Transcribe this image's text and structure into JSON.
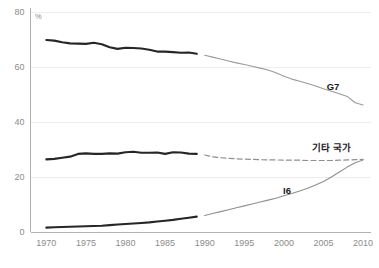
{
  "chart_data": {
    "type": "line",
    "title": "",
    "subtitle": "",
    "xlabel": "",
    "ylabel": "",
    "unit_label": "%",
    "xlim": [
      1968,
      2011
    ],
    "ylim": [
      0,
      80
    ],
    "grid": true,
    "grid_axis": "y",
    "legend_position": "inline-right",
    "break_year": 1990,
    "note": "Each series is drawn as a thick dark solid segment for 1970-1989 and a thin grey segment (solid or dashed) for 1990-2010.",
    "yticks": [
      0,
      20,
      40,
      60,
      80
    ],
    "ytick_labels": [
      "0",
      "20",
      "40",
      "60",
      "80"
    ],
    "xticks": [
      1970,
      1975,
      1980,
      1985,
      1990,
      1995,
      2000,
      2005,
      2010
    ],
    "xtick_labels": [
      "1970",
      "1975",
      "1980",
      "1985",
      "1990",
      "1995",
      "2000",
      "2005",
      "2010"
    ],
    "series": [
      {
        "name": "G7",
        "label": "G7",
        "label_x": 2006.2,
        "label_y": 51.5,
        "color": "#9a9a9a",
        "early_color": "#262626",
        "style_early": "solid-thick",
        "style_late": "solid-thin",
        "x": [
          1970,
          1971,
          1972,
          1973,
          1974,
          1975,
          1976,
          1977,
          1978,
          1979,
          1980,
          1981,
          1982,
          1983,
          1984,
          1985,
          1986,
          1987,
          1988,
          1989
        ],
        "values": [
          69.8,
          69.6,
          69.0,
          68.6,
          68.5,
          68.4,
          68.8,
          68.3,
          67.2,
          66.6,
          67.0,
          66.9,
          66.7,
          66.3,
          65.6,
          65.6,
          65.4,
          65.2,
          65.3,
          64.8
        ],
        "x_late": [
          1990,
          1991,
          1992,
          1993,
          1994,
          1995,
          1996,
          1997,
          1998,
          1999,
          2000,
          2001,
          2002,
          2003,
          2004,
          2005,
          2006,
          2007,
          2008,
          2009,
          2010
        ],
        "values_late": [
          64.3,
          63.6,
          62.9,
          62.2,
          61.5,
          60.9,
          60.3,
          59.6,
          58.9,
          57.9,
          56.6,
          55.6,
          54.8,
          54.0,
          53.1,
          52.1,
          51.2,
          50.3,
          49.3,
          47.0,
          46.2
        ]
      },
      {
        "name": "기타 국가",
        "label": "기타 국가",
        "label_x": 2006.0,
        "label_y": 29.6,
        "color": "#8f8f8f",
        "early_color": "#262626",
        "style_early": "solid-thick",
        "style_late": "dashed-thin",
        "x": [
          1970,
          1971,
          1972,
          1973,
          1974,
          1975,
          1976,
          1977,
          1978,
          1979,
          1980,
          1981,
          1982,
          1983,
          1984,
          1985,
          1986,
          1987,
          1988,
          1989
        ],
        "values": [
          26.4,
          26.6,
          27.0,
          27.4,
          28.4,
          28.6,
          28.4,
          28.4,
          28.6,
          28.5,
          29.0,
          29.2,
          28.8,
          28.8,
          28.9,
          28.4,
          29.0,
          28.9,
          28.5,
          28.4
        ],
        "x_late": [
          1990,
          1991,
          1992,
          1993,
          1994,
          1995,
          1996,
          1997,
          1998,
          1999,
          2000,
          2001,
          2002,
          2003,
          2004,
          2005,
          2006,
          2007,
          2008,
          2009,
          2010
        ],
        "values_late": [
          28.0,
          27.3,
          27.0,
          26.8,
          26.6,
          26.5,
          26.4,
          26.3,
          26.2,
          26.2,
          26.1,
          26.1,
          26.1,
          26.0,
          26.0,
          26.0,
          26.0,
          26.1,
          26.2,
          26.3,
          26.4
        ]
      },
      {
        "name": "I6",
        "label": "I6",
        "label_x": 2000.4,
        "label_y": 13.9,
        "color": "#8f8f8f",
        "early_color": "#262626",
        "style_early": "solid-thick",
        "style_late": "solid-thin",
        "x": [
          1970,
          1971,
          1972,
          1973,
          1974,
          1975,
          1976,
          1977,
          1978,
          1979,
          1980,
          1981,
          1982,
          1983,
          1984,
          1985,
          1986,
          1987,
          1988,
          1989
        ],
        "values": [
          1.6,
          1.7,
          1.8,
          1.9,
          2.0,
          2.1,
          2.2,
          2.3,
          2.5,
          2.7,
          2.9,
          3.1,
          3.3,
          3.5,
          3.8,
          4.1,
          4.4,
          4.8,
          5.2,
          5.6
        ],
        "x_late": [
          1990,
          1991,
          1992,
          1993,
          1994,
          1995,
          1996,
          1997,
          1998,
          1999,
          2000,
          2001,
          2002,
          2003,
          2004,
          2005,
          2006,
          2007,
          2008,
          2009,
          2010
        ],
        "values_late": [
          6.0,
          6.7,
          7.4,
          8.1,
          8.8,
          9.5,
          10.2,
          10.9,
          11.6,
          12.3,
          13.2,
          14.0,
          14.9,
          15.9,
          17.1,
          18.4,
          20.0,
          21.8,
          23.6,
          25.2,
          26.2
        ]
      }
    ]
  },
  "style": {
    "axis_color": "#b0b0b0",
    "grid_color": "#ededed",
    "tick_text_color": "#8c8c8c",
    "label_text_color": "#1a1a1a",
    "background": "#ffffff"
  }
}
